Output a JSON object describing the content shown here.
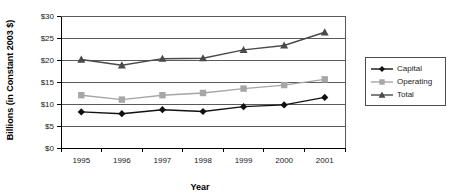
{
  "chart_data": {
    "type": "line",
    "title": "",
    "xlabel": "Year",
    "ylabel": "Billions (in Constant 2003 $)",
    "categories": [
      "1995",
      "1996",
      "1997",
      "1998",
      "1999",
      "2000",
      "2001"
    ],
    "x": [
      1995,
      1996,
      1997,
      1998,
      1999,
      2000,
      2001
    ],
    "ylim": [
      0,
      30
    ],
    "ytick_values": [
      0,
      5,
      10,
      15,
      20,
      25,
      30
    ],
    "ytick_labels": [
      "$0",
      "$5",
      "$10",
      "$15",
      "$20",
      "$25",
      "$30"
    ],
    "grid": "horizontal",
    "legend_position": "right",
    "series": [
      {
        "name": "Capital",
        "marker": "diamond",
        "color": "#111111",
        "values": [
          8.2,
          7.8,
          8.7,
          8.3,
          9.4,
          9.8,
          11.5
        ]
      },
      {
        "name": "Operating",
        "marker": "square",
        "color": "#a6a6a6",
        "values": [
          12.0,
          11.0,
          12.0,
          12.5,
          13.5,
          14.3,
          15.6
        ]
      },
      {
        "name": "Total",
        "marker": "triangle",
        "color": "#4a4a4a",
        "values": [
          20.1,
          18.8,
          20.3,
          20.4,
          22.3,
          23.3,
          26.3
        ]
      }
    ]
  },
  "legend": {
    "items": [
      {
        "label": "Capital"
      },
      {
        "label": "Operating"
      },
      {
        "label": "Total"
      }
    ]
  },
  "axes": {
    "y_title": "Billions (in Constant 2003 $)",
    "x_title": "Year"
  }
}
